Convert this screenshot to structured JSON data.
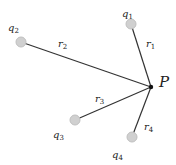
{
  "diagram": {
    "point": {
      "label": "P",
      "x": 151,
      "y": 87
    },
    "charges": [
      {
        "label": "q",
        "sub": "1",
        "x": 131,
        "y": 24,
        "lx": 122,
        "ly": 17,
        "r": "r",
        "rsub": "1",
        "rx": 146,
        "ry": 47
      },
      {
        "label": "q",
        "sub": "2",
        "x": 21,
        "y": 42,
        "lx": 8,
        "ly": 31,
        "r": "r",
        "rsub": "2",
        "rx": 58,
        "ry": 47
      },
      {
        "label": "q",
        "sub": "3",
        "x": 75,
        "y": 120,
        "lx": 53,
        "ly": 138,
        "r": "r",
        "rsub": "3",
        "rx": 95,
        "ry": 102
      },
      {
        "label": "q",
        "sub": "4",
        "x": 132,
        "y": 137,
        "lx": 112,
        "ly": 158,
        "r": "r",
        "rsub": "4",
        "rx": 144,
        "ry": 130
      }
    ]
  }
}
